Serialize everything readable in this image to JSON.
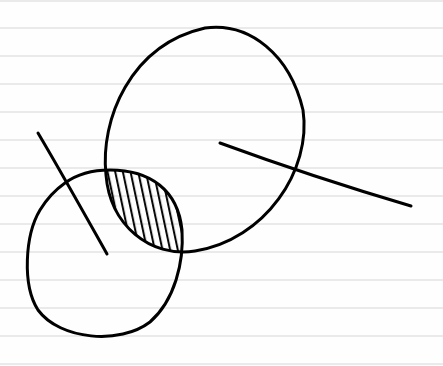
{
  "paper": {
    "background": "#fefefe",
    "rule_color": "#d6d6d6",
    "rule_spacing_px": 28,
    "rule_first_y": 1
  },
  "sketch": {
    "ink_color": "#000000",
    "large_circle": {
      "label": ""
    },
    "small_circle": {
      "label": ""
    },
    "intersection": {
      "fill": "hatched"
    },
    "large_radius_line": {
      "label": ""
    },
    "small_radius_line": {
      "label": ""
    }
  }
}
